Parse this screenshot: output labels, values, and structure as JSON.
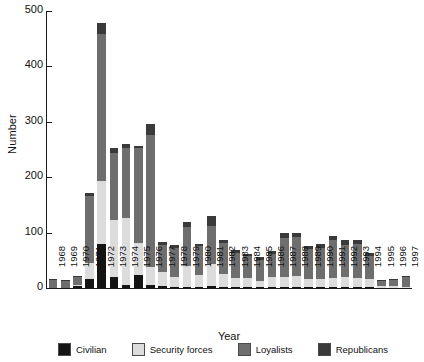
{
  "chart_data": {
    "type": "bar",
    "subtype": "stacked-bar",
    "title": "",
    "xlabel": "Year",
    "ylabel": "Number",
    "ylim": [
      0,
      500
    ],
    "yticks": [
      0,
      100,
      200,
      300,
      400,
      500
    ],
    "grid": false,
    "legend_position": "bottom",
    "categories": [
      "1968",
      "1969",
      "1970",
      "1971",
      "1972",
      "1973",
      "1974",
      "1975",
      "1976",
      "1977",
      "1978",
      "1979",
      "1980",
      "1981",
      "1982",
      "1983",
      "1984",
      "1985",
      "1986",
      "1987",
      "1988",
      "1989",
      "1990",
      "1991",
      "1992",
      "1993",
      "1994",
      "1995",
      "1996",
      "1997"
    ],
    "series": [
      {
        "name": "Civilian",
        "color": "#141414",
        "values": [
          0,
          0,
          3,
          16,
          79,
          19,
          6,
          24,
          6,
          3,
          2,
          2,
          2,
          4,
          2,
          2,
          2,
          2,
          1,
          2,
          2,
          2,
          2,
          2,
          2,
          2,
          2,
          0,
          0,
          0
        ]
      },
      {
        "name": "Security forces",
        "color": "#dcdcdc",
        "values": [
          0,
          0,
          2,
          30,
          114,
          104,
          120,
          57,
          32,
          26,
          18,
          38,
          22,
          40,
          24,
          16,
          16,
          10,
          18,
          18,
          20,
          14,
          14,
          16,
          18,
          16,
          14,
          4,
          3,
          2
        ]
      },
      {
        "name": "Loyalists",
        "color": "#6e6e6e",
        "values": [
          14,
          12,
          15,
          120,
          266,
          121,
          126,
          172,
          238,
          48,
          53,
          70,
          52,
          68,
          56,
          46,
          40,
          38,
          42,
          70,
          70,
          54,
          56,
          68,
          58,
          62,
          42,
          8,
          12,
          18
        ]
      },
      {
        "name": "Republicans",
        "color": "#3a3a3a",
        "values": [
          2,
          2,
          1,
          5,
          19,
          8,
          8,
          4,
          20,
          6,
          4,
          10,
          4,
          18,
          4,
          4,
          4,
          6,
          6,
          10,
          8,
          6,
          8,
          8,
          8,
          6,
          6,
          2,
          2,
          2
        ]
      }
    ],
    "totals": [
      16,
      14,
      21,
      171,
      478,
      252,
      260,
      257,
      296,
      83,
      77,
      120,
      80,
      130,
      86,
      68,
      62,
      56,
      67,
      100,
      100,
      76,
      80,
      94,
      86,
      86,
      64,
      14,
      17,
      22
    ]
  },
  "legend": {
    "items": [
      {
        "label": "Civilian",
        "color": "#141414"
      },
      {
        "label": "Security forces",
        "color": "#dcdcdc"
      },
      {
        "label": "Loyalists",
        "color": "#6e6e6e"
      },
      {
        "label": "Republicans",
        "color": "#3a3a3a"
      }
    ]
  }
}
